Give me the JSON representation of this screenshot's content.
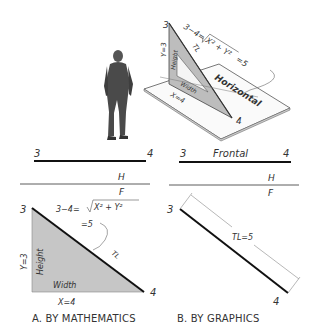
{
  "figure": {
    "pictorial": {
      "point_start": "3",
      "point_end": "4",
      "equation_left": "3−4=",
      "equation_radicand": "X² + Y²",
      "equation_result": "=5",
      "true_length_label": "TL",
      "height_label": "Height",
      "width_label": "Width",
      "y_label": "Y=3",
      "x_label": "X=4",
      "plane_label": "Horizontal"
    },
    "view_a": {
      "top": {
        "point_start": "3",
        "point_end": "4"
      },
      "fold": {
        "upper": "H",
        "lower": "F"
      },
      "front": {
        "point_start": "3",
        "point_end": "4",
        "equation_left": "3−4=",
        "equation_radicand": "X² + Y²",
        "equation_result": "=5",
        "true_length_label": "TL",
        "height_label": "Height",
        "width_label": "Width",
        "y_label": "Y=3",
        "x_label": "X=4"
      },
      "caption": "A. BY MATHEMATICS"
    },
    "view_b": {
      "top": {
        "point_start": "3",
        "point_end": "4",
        "line_label": "Frontal"
      },
      "fold": {
        "upper": "H",
        "lower": "F"
      },
      "front": {
        "point_start": "3",
        "point_end": "4",
        "true_length_label": "TL=5"
      },
      "caption": "B. BY GRAPHICS"
    }
  }
}
